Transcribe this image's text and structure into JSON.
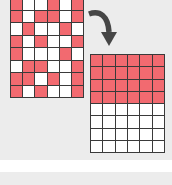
{
  "colors": {
    "filled": "#f26a70",
    "empty": "#ffffff",
    "grid_line": "#3a3a3a",
    "arrow": "#464646",
    "background": "#ececec"
  },
  "left_grid": {
    "columns": 6,
    "rows": [
      [
        1,
        0,
        0,
        1,
        0,
        1
      ],
      [
        1,
        0,
        1,
        1,
        0,
        1
      ],
      [
        0,
        1,
        0,
        0,
        1,
        0
      ],
      [
        1,
        0,
        1,
        0,
        0,
        1
      ],
      [
        1,
        0,
        0,
        0,
        1,
        0
      ],
      [
        0,
        1,
        1,
        0,
        0,
        1
      ],
      [
        1,
        1,
        0,
        1,
        0,
        1
      ],
      [
        1,
        0,
        1,
        0,
        0,
        1
      ]
    ]
  },
  "right_grid": {
    "columns": 6,
    "rows": [
      [
        1,
        1,
        1,
        1,
        1,
        1
      ],
      [
        1,
        1,
        1,
        1,
        1,
        1
      ],
      [
        1,
        1,
        1,
        1,
        1,
        1
      ],
      [
        1,
        1,
        1,
        1,
        1,
        1
      ],
      [
        0,
        0,
        0,
        0,
        0,
        0
      ],
      [
        0,
        0,
        0,
        0,
        0,
        0
      ],
      [
        0,
        0,
        0,
        0,
        0,
        0
      ],
      [
        0,
        0,
        0,
        0,
        0,
        0
      ]
    ]
  },
  "arrow": {
    "icon": "curved-arrow-down-right",
    "direction": "left-grid-to-right-grid"
  }
}
